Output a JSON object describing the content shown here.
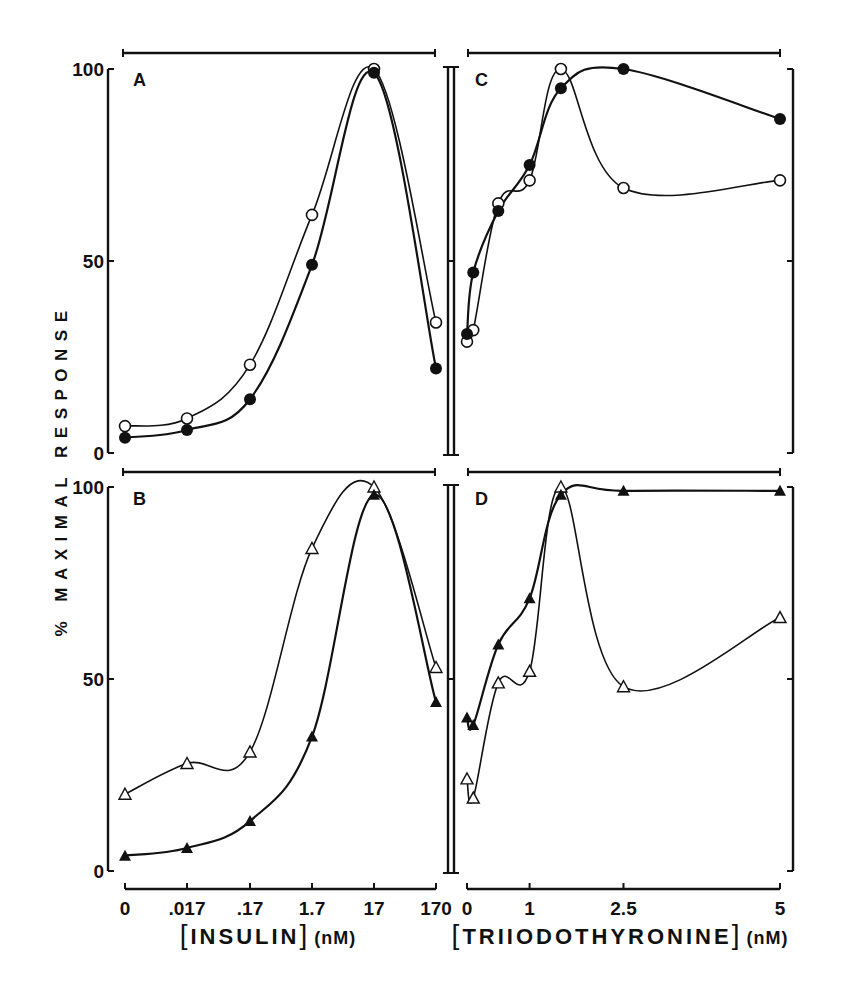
{
  "figure": {
    "y_axis_label": "% MAXIMAL RESPONSE",
    "y_ticks": [
      "0",
      "50",
      "100"
    ],
    "insulin_axis": {
      "label_bracket": "INSULIN",
      "unit": "(nM)",
      "ticks": [
        "0",
        ".017",
        ".17",
        "1.7",
        "17",
        "170"
      ]
    },
    "t3_axis": {
      "label_bracket": "TRIIODOTHYRONINE",
      "unit": "(nM)",
      "ticks": [
        "0",
        "1",
        "2.5",
        "5"
      ]
    },
    "panel_labels": [
      "A",
      "B",
      "C",
      "D"
    ]
  },
  "chart_data": [
    {
      "panel": "A",
      "type": "line",
      "title": "A",
      "xlabel": "[INSULIN] (nM)",
      "ylabel": "% MAXIMAL RESPONSE",
      "categories": [
        "0",
        ".017",
        ".17",
        "1.7",
        "17",
        "170"
      ],
      "ylim": [
        0,
        100
      ],
      "grid": false,
      "series": [
        {
          "name": "open circles",
          "marker": "open-circle",
          "values": [
            7,
            9,
            23,
            62,
            100,
            34
          ]
        },
        {
          "name": "filled circles",
          "marker": "filled-circle",
          "values": [
            4,
            6,
            14,
            49,
            99,
            22
          ]
        }
      ]
    },
    {
      "panel": "B",
      "type": "line",
      "title": "B",
      "xlabel": "[INSULIN] (nM)",
      "ylabel": "% MAXIMAL RESPONSE",
      "categories": [
        "0",
        ".017",
        ".17",
        "1.7",
        "17",
        "170"
      ],
      "ylim": [
        0,
        100
      ],
      "grid": false,
      "series": [
        {
          "name": "open triangles",
          "marker": "open-triangle",
          "values": [
            20,
            28,
            31,
            84,
            100,
            53
          ]
        },
        {
          "name": "filled triangles",
          "marker": "filled-triangle",
          "values": [
            4,
            6,
            13,
            35,
            98,
            44
          ]
        }
      ]
    },
    {
      "panel": "C",
      "type": "line",
      "title": "C",
      "xlabel": "[TRIIODOTHYRONINE] (nM)",
      "ylabel": "% MAXIMAL RESPONSE",
      "x": [
        0,
        0.1,
        0.5,
        1.0,
        1.5,
        2.5,
        5
      ],
      "xlim": [
        0,
        5
      ],
      "ylim": [
        0,
        100
      ],
      "grid": false,
      "series": [
        {
          "name": "open circles",
          "marker": "open-circle",
          "x": [
            0,
            0.1,
            0.5,
            1.0,
            1.5,
            2.5,
            5
          ],
          "values": [
            29,
            32,
            65,
            71,
            100,
            69,
            71
          ]
        },
        {
          "name": "filled circles",
          "marker": "filled-circle",
          "x": [
            0,
            0.1,
            0.5,
            1.0,
            1.5,
            2.5,
            5
          ],
          "values": [
            31,
            47,
            63,
            75,
            95,
            100,
            87
          ]
        }
      ]
    },
    {
      "panel": "D",
      "type": "line",
      "title": "D",
      "xlabel": "[TRIIODOTHYRONINE] (nM)",
      "ylabel": "% MAXIMAL RESPONSE",
      "x": [
        0,
        0.1,
        0.5,
        1.0,
        1.5,
        2.5,
        5
      ],
      "xlim": [
        0,
        5
      ],
      "ylim": [
        0,
        100
      ],
      "grid": false,
      "series": [
        {
          "name": "open triangles",
          "marker": "open-triangle",
          "x": [
            0,
            0.1,
            0.5,
            1.0,
            1.5,
            2.5,
            5
          ],
          "values": [
            24,
            19,
            49,
            52,
            100,
            48,
            66
          ]
        },
        {
          "name": "filled triangles",
          "marker": "filled-triangle",
          "x": [
            0,
            0.1,
            0.5,
            1.0,
            1.5,
            2.5,
            5
          ],
          "values": [
            40,
            38,
            59,
            71,
            98,
            99,
            99
          ]
        }
      ]
    }
  ]
}
